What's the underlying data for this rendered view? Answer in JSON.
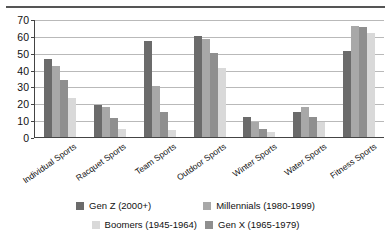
{
  "chart_data": {
    "type": "bar",
    "title": "",
    "subtitle": "",
    "xlabel": "",
    "ylabel": "",
    "ylim": [
      0,
      70
    ],
    "yticks": [
      0,
      10,
      20,
      30,
      40,
      50,
      60,
      70
    ],
    "grid": true,
    "legend_position": "bottom",
    "categories": [
      "Individual Sports",
      "Racquet Sports",
      "Team Sports",
      "Outdoor Sports",
      "Winter Sports",
      "Water Sports",
      "Fitness Sports"
    ],
    "series": [
      {
        "name": "Gen Z (2000+)",
        "color": "#6b6b6b",
        "values": [
          46,
          19,
          57,
          60,
          12,
          15,
          51
        ]
      },
      {
        "name": "Millennials (1980-1999)",
        "color": "#a8a8a8",
        "values": [
          42,
          18,
          30,
          58,
          9,
          18,
          66
        ]
      },
      {
        "name": "Boomers (1945-1964)",
        "color": "#d9d9d9",
        "values": [
          23,
          5,
          4,
          41,
          3,
          9,
          62
        ]
      },
      {
        "name": "Gen X (1965-1979)",
        "color": "#8f8f8f",
        "values": [
          34,
          11,
          15,
          50,
          5,
          12,
          65
        ]
      }
    ],
    "series_draw_order": [
      0,
      1,
      3,
      2
    ]
  }
}
